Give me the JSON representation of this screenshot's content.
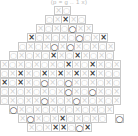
{
  "title": "(p = g .. 1 x)",
  "legend": {
    "x_symbol": "×",
    "o_symbol": "○",
    "faint_color": "#d2d2d2",
    "bold_x_color": "#3a3a3a",
    "bold_o_color": "#4a4a4a",
    "cell_border_color": "#c9c9c9",
    "background_color": "#ffffff"
  },
  "board": {
    "shape": "diamond",
    "cell_size_px": 9,
    "columns": 15,
    "rows": 14,
    "mark_key": {
      "x": "faint cross",
      "o": "faint circle",
      "X": "bold cross",
      "O": "bold circle",
      ".": "outside board"
    },
    "rows_data": [
      "......xo.......",
      ".....oxXxo.....",
      "....xoxoOxx....",
      "...Xoxoxo0oxX..",
      "..oxoxOxOxoxox.",
      ".oxoxoXxoXxoxo.",
      "xoxoxoxoXxoXxox",
      "oxXxoXxXxXxXxoo",
      "XoXxoOxoOxoxoxo",
      "oxoxoxoxOxoOxox",
      "oxoxxOxoxOxoxox",
      ".Oxoxoxxoxoxox.",
      "..xOxoxXoxoxo.O",
      "...xoxXXoOX...."
    ]
  }
}
